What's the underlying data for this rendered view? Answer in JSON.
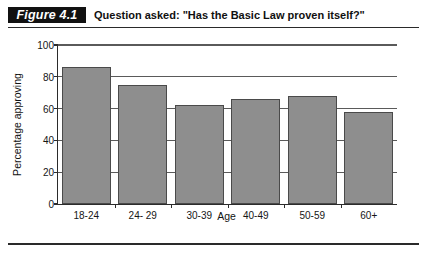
{
  "figure": {
    "badge_label": "Figure 4.1",
    "caption": "Question asked: \"Has the Basic Law proven itself?\""
  },
  "chart_data": {
    "type": "bar",
    "title": "Question asked: \"Has the Basic Law proven itself?\"",
    "categories": [
      "18-24",
      "24- 29",
      "30-39",
      "40-49",
      "50-59",
      "60+"
    ],
    "values": [
      86,
      75,
      62,
      66,
      68,
      58
    ],
    "xlabel": "Age",
    "ylabel": "Percentage approving",
    "ylim": [
      0,
      100
    ],
    "yticks": [
      0,
      20,
      40,
      60,
      80,
      100
    ],
    "ytick_labels": [
      "0",
      "20",
      "40",
      "60",
      "80",
      "100"
    ],
    "grid": "horizontal",
    "legend": "none",
    "bar_color": "#8e8e8e",
    "bar_border_color": "#4a4a4a",
    "axis_color": "#2b2b2b",
    "gridline_color": "#5a5a5a"
  }
}
